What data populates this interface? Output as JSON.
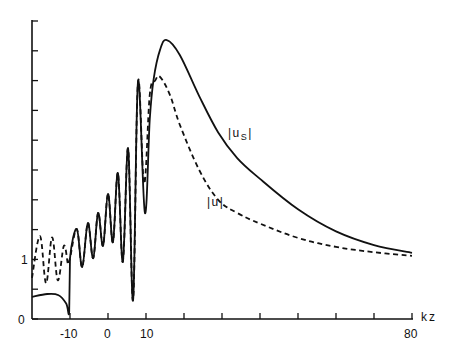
{
  "chart_data": {
    "type": "line",
    "title": "",
    "xlabel": "kz",
    "ylabel": "",
    "xlim": [
      -20,
      80
    ],
    "ylim": [
      0,
      5
    ],
    "grid": false,
    "legend": "inline labels on curves",
    "x_tick_labels": [
      "-10",
      "0",
      "10",
      "80"
    ],
    "x_ticks": [
      -10,
      0,
      10,
      20,
      30,
      40,
      50,
      60,
      70,
      80
    ],
    "y_tick_labels": [
      "0",
      "1"
    ],
    "y_ticks": [
      0,
      0.5,
      1,
      1.5,
      2,
      2.5,
      3,
      3.5,
      4,
      4.5,
      5
    ],
    "series": [
      {
        "name": "|u_s|",
        "label": "|us|",
        "style": "solid",
        "points": [
          [
            -20,
            0.37
          ],
          [
            -16,
            0.42
          ],
          [
            -13,
            0.4
          ],
          [
            -11,
            0.26
          ],
          [
            -10.2,
            0.12
          ],
          [
            -10,
            1.02
          ],
          [
            -8.2,
            1.51
          ],
          [
            -6.8,
            0.87
          ],
          [
            -5.3,
            1.61
          ],
          [
            -3.9,
            1.02
          ],
          [
            -2.6,
            1.78
          ],
          [
            -1.3,
            1.23
          ],
          [
            0,
            2.1
          ],
          [
            1.3,
            1.29
          ],
          [
            2.6,
            2.45
          ],
          [
            3.9,
            0.96
          ],
          [
            5.3,
            2.86
          ],
          [
            6.6,
            0.32
          ],
          [
            7.9,
            3.98
          ],
          [
            9.7,
            1.78
          ],
          [
            11,
            3.36
          ],
          [
            12,
            4.02
          ],
          [
            13.7,
            4.52
          ],
          [
            15.5,
            4.68
          ],
          [
            18.9,
            4.43
          ],
          [
            24,
            3.74
          ],
          [
            29,
            3.13
          ],
          [
            34,
            2.7
          ],
          [
            40,
            2.35
          ],
          [
            50,
            1.84
          ],
          [
            60,
            1.47
          ],
          [
            70,
            1.24
          ],
          [
            80,
            1.11
          ]
        ]
      },
      {
        "name": "|u|",
        "label": "|u|",
        "style": "dashed",
        "points": [
          [
            -20,
            0.69
          ],
          [
            -17.9,
            1.39
          ],
          [
            -16.3,
            0.6
          ],
          [
            -14.7,
            1.37
          ],
          [
            -13.2,
            0.65
          ],
          [
            -11.6,
            1.23
          ],
          [
            -10.5,
            0.91
          ],
          [
            -10,
            1.02
          ],
          [
            -8.2,
            1.51
          ],
          [
            -6.8,
            0.87
          ],
          [
            -5.3,
            1.61
          ],
          [
            -3.9,
            1.02
          ],
          [
            -2.6,
            1.78
          ],
          [
            -1.3,
            1.23
          ],
          [
            0,
            2.1
          ],
          [
            1.3,
            1.29
          ],
          [
            2.6,
            2.45
          ],
          [
            3.9,
            0.96
          ],
          [
            5.3,
            2.86
          ],
          [
            6.6,
            0.32
          ],
          [
            7.9,
            3.98
          ],
          [
            9.5,
            2.27
          ],
          [
            11,
            3.77
          ],
          [
            12.4,
            4.0
          ],
          [
            13.7,
            4.06
          ],
          [
            16.3,
            3.76
          ],
          [
            18.9,
            3.26
          ],
          [
            24,
            2.5
          ],
          [
            29,
            2.0
          ],
          [
            34,
            1.78
          ],
          [
            40,
            1.6
          ],
          [
            50,
            1.36
          ],
          [
            60,
            1.21
          ],
          [
            70,
            1.12
          ],
          [
            80,
            1.06
          ]
        ]
      }
    ],
    "annotations": [
      {
        "text": "|us|",
        "near_series": "|u_s|",
        "x": 32,
        "y": 3.1
      },
      {
        "text": "|u|",
        "near_series": "|u|",
        "x": 27,
        "y": 1.95
      }
    ]
  },
  "labels": {
    "y_zero": "0",
    "y_one": "1",
    "x_m10": "-10",
    "x_0": "0",
    "x_10": "10",
    "x_80": "80",
    "x_axis_name": "kz",
    "curve_us_main": "|u",
    "curve_us_sub": "S",
    "curve_us_end": "|",
    "curve_u": "|u|"
  }
}
